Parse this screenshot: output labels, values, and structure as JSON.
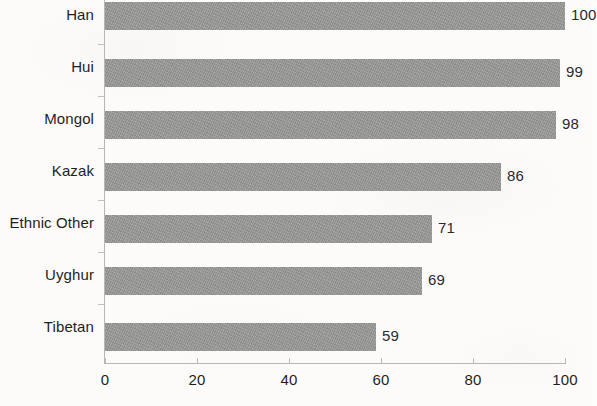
{
  "chart_data": {
    "type": "bar",
    "orientation": "horizontal",
    "title": "",
    "subtitle": "",
    "xlabel": "",
    "ylabel": "",
    "categories": [
      "Han",
      "Hui",
      "Mongol",
      "Kazak",
      "Ethnic Other",
      "Uyghur",
      "Tibetan"
    ],
    "values": [
      100,
      99,
      98,
      86,
      71,
      69,
      59
    ],
    "value_labels": [
      "100",
      "99",
      "98",
      "86",
      "71",
      "69",
      "59"
    ],
    "xlim": [
      0,
      100
    ],
    "xticks": [
      0,
      20,
      40,
      60,
      80,
      100
    ],
    "xtick_labels": [
      "0",
      "20",
      "40",
      "60",
      "80",
      "100"
    ],
    "grid": false,
    "legend": false,
    "bar_color": "#989897",
    "axis_color": "#b9b7b4",
    "text_color": "#1f1f1f",
    "background_color": "#fcfbfa"
  }
}
